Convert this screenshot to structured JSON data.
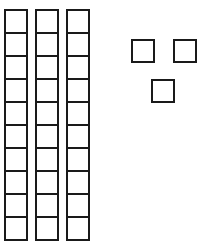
{
  "diagram": {
    "type": "base-ten-blocks",
    "stroke_color": "#1a1a1a",
    "background": "#ffffff",
    "tens": {
      "count": 3,
      "cells_per_rod_visible": 10,
      "rods": [
        {
          "x": 4,
          "y": 9
        },
        {
          "x": 35,
          "y": 9
        },
        {
          "x": 66,
          "y": 9
        }
      ]
    },
    "ones": {
      "count": 3,
      "units": [
        {
          "x": 131,
          "y": 39
        },
        {
          "x": 173,
          "y": 39
        },
        {
          "x": 151,
          "y": 79
        }
      ]
    },
    "represented_value": "33"
  }
}
